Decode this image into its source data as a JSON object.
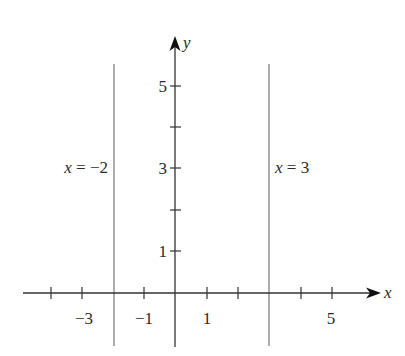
{
  "diagram": {
    "title": "",
    "axes": {
      "x_label": "x",
      "y_label": "y",
      "x_ticks": [
        -4,
        -3,
        -2,
        -1,
        0,
        1,
        2,
        3,
        4,
        5
      ],
      "x_tick_labels": [
        {
          "value": -3,
          "text": "−3"
        },
        {
          "value": -1,
          "text": "−1"
        },
        {
          "value": 1,
          "text": "1"
        },
        {
          "value": 5,
          "text": "5"
        }
      ],
      "y_ticks": [
        1,
        2,
        3,
        4,
        5
      ],
      "y_tick_labels": [
        {
          "value": 1,
          "text": "1"
        },
        {
          "value": 3,
          "text": "3"
        },
        {
          "value": 5,
          "text": "5"
        }
      ],
      "axis_color": "#333333"
    },
    "lines": [
      {
        "equation": "x = −2",
        "x": -2,
        "var": "x",
        "rest": " = −2",
        "color": "#8a8a8a"
      },
      {
        "equation": "x = 3",
        "x": 3,
        "var": "x",
        "rest": " = 3",
        "color": "#8a8a8a"
      }
    ]
  }
}
